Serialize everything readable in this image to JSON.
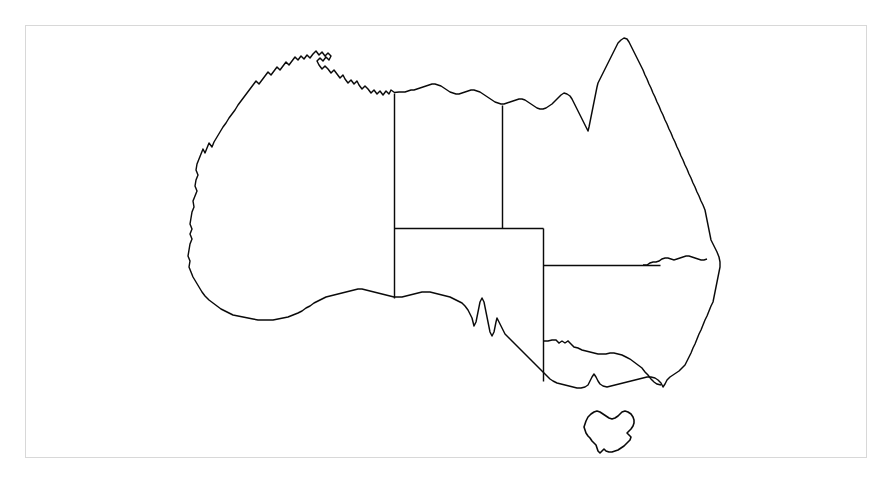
{
  "document": {
    "title": "Map of Australia",
    "type": "outline map",
    "subject": "Australia",
    "description": "Black-and-white outline map of Australia showing the national coastline and the internal state and territory boundaries, plus the island of Tasmania.",
    "canvas": {
      "width": 889,
      "height": 478
    },
    "background_color": "#ffffff",
    "line_color": "#0a0a0a",
    "frame_color": "#d8d8d8",
    "has_labels": false,
    "has_legend": false,
    "has_scale_bar": false,
    "has_compass": false,
    "has_graticule": false
  },
  "frame": {
    "name": "map-border-frame",
    "x": 25,
    "y": 25,
    "width": 842,
    "height": 433,
    "stroke": "#d8d8d8",
    "stroke_width": 1
  },
  "landmasses": [
    {
      "name": "mainland-australia",
      "label": "Australian mainland",
      "fill": "#ffffff",
      "stroke": "#0a0a0a"
    },
    {
      "name": "tasmania",
      "label": "Tasmania",
      "fill": "#ffffff",
      "stroke": "#0a0a0a"
    }
  ],
  "internal_borders": [
    {
      "name": "wa-nt-sa-border",
      "label": "Western Australia eastern border",
      "orientation": "vertical",
      "x": 394,
      "y_start": 93,
      "y_end": 298
    },
    {
      "name": "nt-qld-border",
      "label": "Northern Territory / Queensland border",
      "orientation": "vertical",
      "x": 502,
      "y_start": 105,
      "y_end": 228
    },
    {
      "name": "nt-sa-border",
      "label": "Northern Territory / South Australia border",
      "orientation": "horizontal",
      "y": 228,
      "x_start": 394,
      "x_end": 543
    },
    {
      "name": "sa-qld-nsw-vic-border",
      "label": "South Australia eastern border",
      "orientation": "vertical",
      "x": 543,
      "y_start": 228,
      "y_end": 381
    },
    {
      "name": "sa-nsw-qld-border",
      "label": "Queensland / New South Wales southern border",
      "orientation": "horizontal",
      "y": 265,
      "x_start": 543,
      "x_end": 660
    }
  ],
  "regions": [
    {
      "name": "region-western-australia",
      "label": "Western Australia"
    },
    {
      "name": "region-northern-territory",
      "label": "Northern Territory"
    },
    {
      "name": "region-queensland",
      "label": "Queensland"
    },
    {
      "name": "region-south-australia",
      "label": "South Australia"
    },
    {
      "name": "region-new-south-wales",
      "label": "New South Wales"
    },
    {
      "name": "region-victoria",
      "label": "Victoria"
    },
    {
      "name": "region-tasmania",
      "label": "Tasmania"
    }
  ],
  "geographic_features": [
    {
      "name": "feature-cape-york",
      "label": "Cape York Peninsula"
    },
    {
      "name": "feature-gulf-of-carpentaria",
      "label": "Gulf of Carpentaria"
    },
    {
      "name": "feature-arnhem-land",
      "label": "Arnhem Land"
    },
    {
      "name": "feature-kimberley",
      "label": "Kimberley coast"
    },
    {
      "name": "feature-great-australian-bight",
      "label": "Great Australian Bight"
    },
    {
      "name": "feature-eyre-peninsula",
      "label": "Eyre Peninsula"
    },
    {
      "name": "feature-spencer-gulf",
      "label": "Spencer Gulf"
    },
    {
      "name": "feature-yorke-peninsula",
      "label": "Yorke Peninsula"
    },
    {
      "name": "feature-gulf-st-vincent",
      "label": "Gulf St Vincent"
    },
    {
      "name": "feature-port-phillip-bay",
      "label": "Port Phillip Bay"
    },
    {
      "name": "feature-wilsons-promontory",
      "label": "Wilsons Promontory"
    },
    {
      "name": "feature-bass-strait",
      "label": "Bass Strait"
    }
  ]
}
